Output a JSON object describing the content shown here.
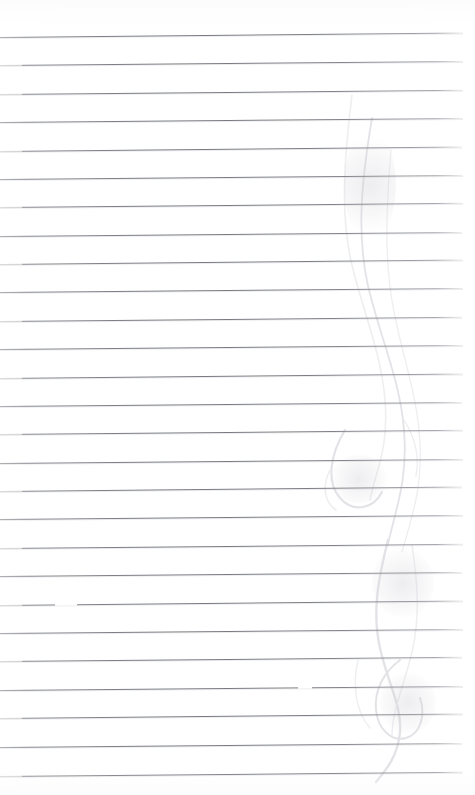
{
  "document": {
    "kind": "scanned-lined-notebook-page",
    "title": "Blank ruled notebook page",
    "page_width": 475,
    "page_height": 795,
    "background_color": "#ffffff",
    "rule_color": "#7a7c82",
    "ghost_color": "#c9c7cf",
    "written_text": "",
    "handwriting_present": "none",
    "rule_count": 27,
    "first_rule_y": 37,
    "rule_spacing": 28.4,
    "rule_left_x": 0,
    "rule_right_x": 463,
    "rule_tilt_degrees": -0.55,
    "notes_visible": "no text content; blank ruled page with faint bleed-through marks on right side"
  },
  "rules": [
    {
      "y": 37,
      "right": 463,
      "tilt": -0.55,
      "faded_start": false
    },
    {
      "y": 65,
      "right": 463,
      "tilt": -0.5,
      "faded_start": true
    },
    {
      "y": 94,
      "right": 463,
      "tilt": -0.52,
      "faded_start": true
    },
    {
      "y": 122,
      "right": 463,
      "tilt": -0.5,
      "faded_start": false
    },
    {
      "y": 151,
      "right": 462,
      "tilt": -0.55,
      "faded_start": true
    },
    {
      "y": 179,
      "right": 463,
      "tilt": -0.5,
      "faded_start": false
    },
    {
      "y": 207,
      "right": 463,
      "tilt": -0.52,
      "faded_start": true
    },
    {
      "y": 236,
      "right": 462,
      "tilt": -0.5,
      "faded_start": false
    },
    {
      "y": 264,
      "right": 463,
      "tilt": -0.55,
      "faded_start": true
    },
    {
      "y": 292,
      "right": 463,
      "tilt": -0.5,
      "faded_start": false
    },
    {
      "y": 321,
      "right": 462,
      "tilt": -0.52,
      "faded_start": true
    },
    {
      "y": 349,
      "right": 463,
      "tilt": -0.5,
      "faded_start": false
    },
    {
      "y": 378,
      "right": 463,
      "tilt": -0.55,
      "faded_start": true
    },
    {
      "y": 406,
      "right": 462,
      "tilt": -0.5,
      "faded_start": false
    },
    {
      "y": 434,
      "right": 463,
      "tilt": -0.52,
      "faded_start": true
    },
    {
      "y": 463,
      "right": 463,
      "tilt": -0.5,
      "faded_start": false
    },
    {
      "y": 491,
      "right": 462,
      "tilt": -0.55,
      "faded_start": true
    },
    {
      "y": 519,
      "right": 463,
      "tilt": -0.5,
      "faded_start": false
    },
    {
      "y": 548,
      "right": 463,
      "tilt": -0.52,
      "faded_start": true
    },
    {
      "y": 576,
      "right": 462,
      "tilt": -0.5,
      "faded_start": false
    },
    {
      "y": 605,
      "right": 463,
      "tilt": -0.55,
      "faded_start": true,
      "gap_x": 55,
      "gap_w": 22
    },
    {
      "y": 633,
      "right": 463,
      "tilt": -0.5,
      "faded_start": false
    },
    {
      "y": 661,
      "right": 462,
      "tilt": -0.52,
      "faded_start": true
    },
    {
      "y": 690,
      "right": 463,
      "tilt": -0.5,
      "faded_start": false,
      "gap_x": 298,
      "gap_w": 14
    },
    {
      "y": 718,
      "right": 463,
      "tilt": -0.55,
      "faded_start": true
    },
    {
      "y": 747,
      "right": 462,
      "tilt": -0.5,
      "faded_start": false
    },
    {
      "y": 776,
      "right": 463,
      "tilt": -0.52,
      "faded_start": true
    }
  ],
  "ghost_marks": {
    "description": "faint ink bleed-through from reverse side, long curved strokes on the right third of the page",
    "opacity": 0.5,
    "strokes": [
      {
        "d": "M 352 95 C 344 160 340 215 352 265 C 364 315 381 352 385 400 C 389 448 376 470 370 500",
        "w": 1.6,
        "faint": true
      },
      {
        "d": "M 372 118 C 362 178 356 232 368 286 C 381 340 400 380 404 430 C 408 480 396 508 388 544",
        "w": 1.8,
        "faint": false
      },
      {
        "d": "M 391 150 C 386 210 384 262 394 312 C 404 362 418 398 420 444 C 422 490 412 516 402 552",
        "w": 1.3,
        "faint": true
      },
      {
        "d": "M 345 430 C 330 455 326 482 340 498 C 354 514 374 508 382 492",
        "w": 2.2,
        "faint": false
      },
      {
        "d": "M 388 540 C 378 580 372 612 380 648 C 388 684 402 706 400 732 C 398 756 386 770 376 782",
        "w": 2.4,
        "faint": false
      },
      {
        "d": "M 412 545 C 418 585 420 618 412 652 C 404 686 392 710 392 736",
        "w": 1.5,
        "faint": true
      },
      {
        "d": "M 400 660 C 384 672 374 690 376 710 C 378 730 392 742 406 738 C 420 734 426 716 420 698",
        "w": 2.0,
        "faint": false
      },
      {
        "d": "M 358 660 C 352 686 356 712 370 728",
        "w": 1.4,
        "faint": true
      },
      {
        "d": "M 330 470 C 322 486 324 502 336 510",
        "w": 1.6,
        "faint": true
      },
      {
        "d": "M 404 420 C 414 436 420 456 416 476",
        "w": 1.4,
        "faint": true
      }
    ],
    "blobs": [
      {
        "x": 330,
        "y": 455,
        "w": 58,
        "h": 48
      },
      {
        "x": 372,
        "y": 548,
        "w": 62,
        "h": 70
      },
      {
        "x": 380,
        "y": 672,
        "w": 56,
        "h": 62
      },
      {
        "x": 344,
        "y": 130,
        "w": 52,
        "h": 110
      }
    ]
  }
}
